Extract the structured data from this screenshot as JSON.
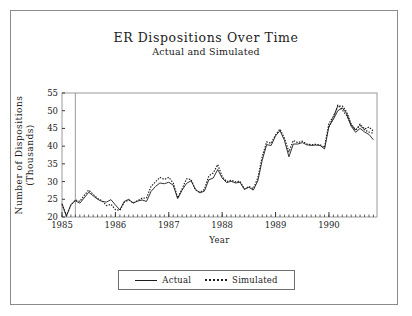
{
  "figure": {
    "title": "ER Dispositions Over Time",
    "subtitle": "Actual and Simulated"
  },
  "legend": {
    "actual_label": "Actual",
    "simulated_label": "Simulated",
    "position": "bottom-center"
  },
  "chart_data": {
    "type": "line",
    "title": "ER Dispositions Over Time",
    "subtitle": "Actual and Simulated",
    "xlabel": "Year",
    "ylabel": "Number of Dispositions (Thousands)",
    "ylabel_line1": "Number of Dispositions",
    "ylabel_line2": "(Thousands)",
    "xlim": [
      1985.0,
      1990.9
    ],
    "ylim": [
      20,
      55
    ],
    "yticks": [
      20,
      25,
      30,
      35,
      40,
      45,
      50,
      55
    ],
    "xticks": [
      1985,
      1986,
      1987,
      1988,
      1989,
      1990
    ],
    "xtick_labels": [
      "1985",
      "1986",
      "1987",
      "1988",
      "1989",
      "1990"
    ],
    "minor_xticks_per_year": 12,
    "grid": false,
    "annotations": [
      {
        "type": "vertical-reference-line",
        "x": 1985.25,
        "label": ""
      }
    ],
    "x": [
      1985.0,
      1985.083,
      1985.167,
      1985.25,
      1985.333,
      1985.417,
      1985.5,
      1985.583,
      1985.667,
      1985.75,
      1985.833,
      1985.917,
      1986.0,
      1986.083,
      1986.167,
      1986.25,
      1986.333,
      1986.417,
      1986.5,
      1986.583,
      1986.667,
      1986.75,
      1986.833,
      1986.917,
      1987.0,
      1987.083,
      1987.167,
      1987.25,
      1987.333,
      1987.417,
      1987.5,
      1987.583,
      1987.667,
      1987.75,
      1987.833,
      1987.917,
      1988.0,
      1988.083,
      1988.167,
      1988.25,
      1988.333,
      1988.417,
      1988.5,
      1988.583,
      1988.667,
      1988.75,
      1988.833,
      1988.917,
      1989.0,
      1989.083,
      1989.167,
      1989.25,
      1989.333,
      1989.417,
      1989.5,
      1989.583,
      1989.667,
      1989.75,
      1989.833,
      1989.917,
      1990.0,
      1990.083,
      1990.167,
      1990.25,
      1990.333,
      1990.417,
      1990.5,
      1990.583,
      1990.667,
      1990.75,
      1990.833
    ],
    "series": [
      {
        "name": "Actual",
        "style": "solid",
        "color": "#1d1d1d",
        "values": [
          23.8,
          20.2,
          23.5,
          24.6,
          23.9,
          25.4,
          27.0,
          26.0,
          25.0,
          24.4,
          24.2,
          24.9,
          23.4,
          22.0,
          24.4,
          25.0,
          23.9,
          24.5,
          24.8,
          24.4,
          27.2,
          28.6,
          29.6,
          29.4,
          29.8,
          29.0,
          25.2,
          27.6,
          29.5,
          30.2,
          27.8,
          26.8,
          27.3,
          30.5,
          31.0,
          33.4,
          31.0,
          29.7,
          30.1,
          29.6,
          29.8,
          27.8,
          28.4,
          27.6,
          30.2,
          36.0,
          40.4,
          40.2,
          42.9,
          44.4,
          41.6,
          37.0,
          40.6,
          40.6,
          41.0,
          40.4,
          40.2,
          40.3,
          40.2,
          39.2,
          45.6,
          47.6,
          50.0,
          50.8,
          49.2,
          45.6,
          43.9,
          45.0,
          44.0,
          43.3,
          41.8
        ]
      },
      {
        "name": "Simulated",
        "style": "dotted",
        "color": "#1d1d1d",
        "values": [
          23.6,
          20.4,
          23.4,
          24.8,
          24.4,
          26.1,
          27.6,
          26.4,
          25.2,
          24.6,
          23.2,
          23.6,
          22.1,
          21.9,
          24.2,
          24.8,
          24.0,
          24.6,
          25.3,
          25.4,
          28.6,
          29.9,
          31.2,
          30.6,
          31.2,
          29.6,
          25.4,
          28.0,
          30.8,
          30.6,
          27.6,
          27.0,
          27.8,
          31.6,
          32.4,
          34.8,
          31.4,
          30.0,
          30.4,
          29.9,
          30.1,
          27.9,
          28.6,
          28.0,
          31.0,
          37.0,
          41.2,
          40.8,
          43.2,
          44.8,
          42.2,
          38.4,
          41.6,
          41.0,
          41.4,
          40.6,
          40.4,
          40.5,
          40.4,
          39.6,
          46.4,
          48.4,
          51.2,
          51.4,
          49.6,
          46.2,
          44.6,
          45.8,
          44.6,
          44.0,
          43.6
        ]
      }
    ],
    "series2_tail": {
      "name": "Simulated",
      "x": [
        1990.0,
        1990.083,
        1990.167,
        1990.25,
        1990.333,
        1990.417,
        1990.5,
        1990.583,
        1990.667,
        1990.75,
        1990.833
      ],
      "values": [
        45.4,
        48.0,
        51.6,
        50.2,
        48.6,
        46.0,
        44.4,
        46.2,
        44.8,
        45.4,
        44.2
      ]
    },
    "late_divergence_note": "Actual dips to ~40.5 at series end while Simulated remains near 43.5"
  },
  "plot_geometry": {
    "left": 62,
    "top": 93,
    "right": 377,
    "bottom": 217
  }
}
